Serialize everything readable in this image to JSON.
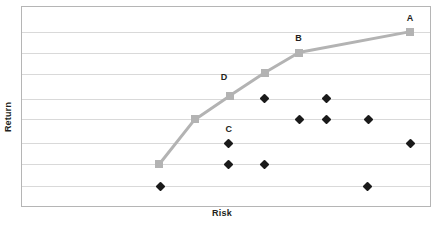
{
  "chart_data": {
    "type": "scatter",
    "title": "",
    "xlabel": "Risk",
    "ylabel": "Return",
    "grid": true,
    "legend": false,
    "xlim": [
      0,
      100
    ],
    "ylim": [
      0,
      100
    ],
    "axis_ticks": {
      "x": [],
      "y": []
    },
    "gridlines_y": [
      87.5,
      77.0,
      66.5,
      54.0,
      43.5,
      31.5,
      21.0,
      10.0
    ],
    "series": [
      {
        "name": "Efficient Frontier",
        "type": "line",
        "marker": "square",
        "color": "#b3b3b3",
        "points": [
          {
            "label": "",
            "x": 33.7,
            "y": 21.0
          },
          {
            "label": "",
            "x": 42.4,
            "y": 43.5
          },
          {
            "label": "D",
            "x": 51.0,
            "y": 55.5
          },
          {
            "label": "",
            "x": 59.5,
            "y": 67.0
          },
          {
            "label": "B",
            "x": 67.8,
            "y": 77.0
          },
          {
            "label": "A",
            "x": 95.1,
            "y": 87.5
          }
        ]
      },
      {
        "name": "Individual Assets",
        "type": "scatter",
        "marker": "diamond",
        "color": "#1a1a1a",
        "points": [
          {
            "label": "",
            "x": 59.5,
            "y": 54.0
          },
          {
            "label": "",
            "x": 74.6,
            "y": 54.0
          },
          {
            "label": "",
            "x": 68.0,
            "y": 43.5
          },
          {
            "label": "",
            "x": 74.6,
            "y": 43.5
          },
          {
            "label": "",
            "x": 84.9,
            "y": 43.5
          },
          {
            "label": "C",
            "x": 50.7,
            "y": 31.5
          },
          {
            "label": "",
            "x": 95.1,
            "y": 31.5
          },
          {
            "label": "",
            "x": 50.7,
            "y": 21.0
          },
          {
            "label": "",
            "x": 59.5,
            "y": 21.0
          },
          {
            "label": "",
            "x": 33.9,
            "y": 10.0
          },
          {
            "label": "",
            "x": 84.6,
            "y": 10.0
          }
        ]
      }
    ],
    "annotations": [
      {
        "text": "A",
        "x": 95.1,
        "y": 94.5
      },
      {
        "text": "B",
        "x": 67.8,
        "y": 84.5
      },
      {
        "text": "C",
        "x": 50.7,
        "y": 38.5
      },
      {
        "text": "D",
        "x": 49.5,
        "y": 65.0
      }
    ],
    "colors": {
      "frontier": "#b3b3b3",
      "assets": "#1a1a1a",
      "grid": "#d9d9d9",
      "border": "#9a9a9a",
      "text": "#231f20",
      "background": "#ffffff"
    }
  }
}
